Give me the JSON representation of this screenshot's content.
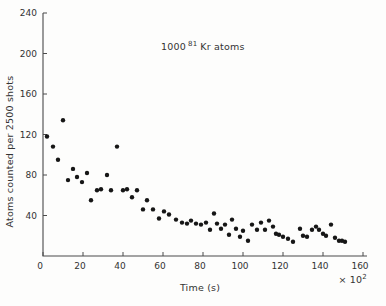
{
  "figure": {
    "background": "#fdfdfc",
    "axis_color": "#4a4a4a",
    "text_color": "#333333",
    "point_color": "#161616",
    "annotation": {
      "prefix": "1000",
      "superscript": "81",
      "suffix": "Kr atoms"
    },
    "x_axis": {
      "label": "Time (s)",
      "scale_base": "× 10",
      "scale_exponent": "2"
    },
    "y_axis": {
      "label": "Atoms counted per 2500 shots"
    }
  },
  "chart_data": {
    "type": "scatter",
    "title": "",
    "annotation": "1000 ⁸¹Kr atoms",
    "xlabel": "Time (s)",
    "x_unit": "×10² s",
    "ylabel": "Atoms counted per 2500 shots",
    "xlim": [
      0,
      160
    ],
    "ylim": [
      0,
      240
    ],
    "x_ticks": [
      0,
      20,
      40,
      60,
      80,
      100,
      120,
      140,
      160
    ],
    "y_ticks": [
      40,
      80,
      120,
      160,
      200,
      240
    ],
    "grid": false,
    "legend": false,
    "marker": "filled-circle",
    "points": [
      [
        2,
        118
      ],
      [
        5,
        108
      ],
      [
        7.5,
        95
      ],
      [
        10,
        134
      ],
      [
        12.5,
        75
      ],
      [
        15,
        86
      ],
      [
        17,
        78
      ],
      [
        19.5,
        73
      ],
      [
        22,
        82
      ],
      [
        24,
        55
      ],
      [
        27,
        65
      ],
      [
        29,
        66
      ],
      [
        32,
        80
      ],
      [
        34,
        65
      ],
      [
        37,
        108
      ],
      [
        40,
        65
      ],
      [
        42,
        66
      ],
      [
        44.5,
        58
      ],
      [
        47,
        65
      ],
      [
        50,
        46
      ],
      [
        52,
        55
      ],
      [
        55,
        46
      ],
      [
        58,
        37
      ],
      [
        60.5,
        44
      ],
      [
        63,
        41
      ],
      [
        66.5,
        36
      ],
      [
        69.5,
        33
      ],
      [
        72,
        32
      ],
      [
        74,
        35
      ],
      [
        76.5,
        32
      ],
      [
        79,
        31
      ],
      [
        81.5,
        33
      ],
      [
        83.5,
        26
      ],
      [
        85.5,
        42
      ],
      [
        87,
        32
      ],
      [
        89,
        27
      ],
      [
        91,
        31
      ],
      [
        93,
        21
      ],
      [
        94.5,
        36
      ],
      [
        96.5,
        27
      ],
      [
        98.5,
        19
      ],
      [
        100,
        25
      ],
      [
        102.5,
        15
      ],
      [
        104.5,
        31
      ],
      [
        107,
        26
      ],
      [
        109,
        33
      ],
      [
        111,
        26
      ],
      [
        113,
        35
      ],
      [
        115,
        29
      ],
      [
        116.5,
        22
      ],
      [
        118,
        21
      ],
      [
        120,
        19
      ],
      [
        122.5,
        17
      ],
      [
        125,
        14
      ],
      [
        128.5,
        27
      ],
      [
        130,
        20
      ],
      [
        132,
        19
      ],
      [
        134.5,
        26
      ],
      [
        136.5,
        29
      ],
      [
        138,
        26
      ],
      [
        140,
        22
      ],
      [
        141.5,
        20
      ],
      [
        144,
        31
      ],
      [
        146,
        18
      ],
      [
        148,
        15
      ],
      [
        149.5,
        15
      ],
      [
        151,
        14
      ]
    ]
  }
}
